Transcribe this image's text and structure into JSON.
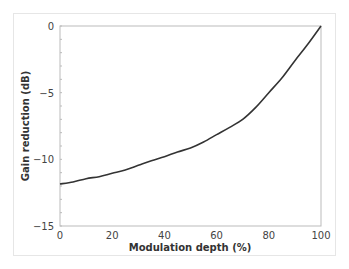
{
  "chart_data": {
    "type": "line",
    "title": "",
    "xlabel": "Modulation depth (%)",
    "ylabel": "Gain reduction (dB)",
    "xlim": [
      0,
      100
    ],
    "ylim": [
      -15,
      0
    ],
    "xticks": [
      0,
      20,
      40,
      60,
      80,
      100
    ],
    "yticks": [
      0,
      -5,
      -10,
      -15
    ],
    "xtick_labels": [
      "0",
      "20",
      "40",
      "60",
      "80",
      "100"
    ],
    "ytick_labels": [
      "0",
      "−5",
      "−10",
      "−15"
    ],
    "grid": false,
    "legend": null,
    "series": [
      {
        "name": "Gain reduction",
        "color": "#333333",
        "x": [
          0,
          5,
          10,
          15,
          20,
          25,
          30,
          35,
          40,
          45,
          50,
          55,
          60,
          65,
          70,
          75,
          80,
          85,
          90,
          95,
          100
        ],
        "y": [
          -11.85,
          -11.7,
          -11.45,
          -11.3,
          -11.05,
          -10.8,
          -10.45,
          -10.1,
          -9.8,
          -9.45,
          -9.15,
          -8.7,
          -8.15,
          -7.6,
          -7.0,
          -6.1,
          -5.0,
          -3.9,
          -2.6,
          -1.35,
          0
        ]
      }
    ]
  }
}
